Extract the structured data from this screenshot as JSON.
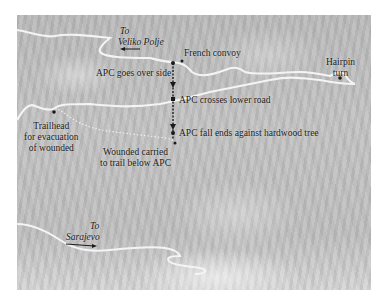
{
  "map": {
    "labels": {
      "veliko_polje_to": "To",
      "veliko_polje_name": "Veliko Polje",
      "french_convoy": "French convoy",
      "apc_over_side": "APC goes over side",
      "hairpin_line1": "Hairpin",
      "hairpin_line2": "turn",
      "apc_crosses": "APC crosses lower road",
      "trailhead_line1": "Trailhead",
      "trailhead_line2": "for evacuation",
      "trailhead_line3": "of wounded",
      "apc_fall_ends": "APC fall ends against hardwood tree",
      "wounded_line1": "Wounded carried",
      "wounded_line2": "to trail below APC",
      "sarajevo_to": "To",
      "sarajevo_name": "Sarajevo"
    },
    "colors": {
      "terrain": "#c2c2c2",
      "road": "#f4f4f4",
      "marker": "#1a1a1a"
    },
    "icons": [
      "arrow-left-icon",
      "arrow-right-icon",
      "arrow-down-icon",
      "point-marker-icon"
    ]
  }
}
